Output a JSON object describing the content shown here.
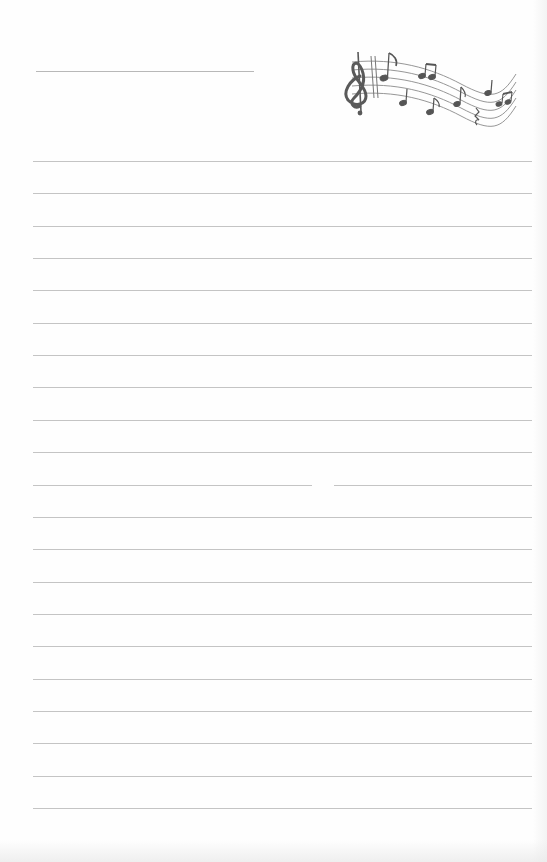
{
  "document": {
    "type": "lined-notepaper",
    "header": {
      "title_line": {
        "x": 36,
        "y": 71,
        "width": 218
      },
      "illustration": "music-staff-with-treble-clef-and-notes"
    },
    "ruled_lines": {
      "count": 21,
      "start_y": 161,
      "spacing": 32.35,
      "left": 33,
      "width": 499
    },
    "colors": {
      "paper": "#fefefe",
      "rule": "#c4c4c4",
      "ink": "#555555"
    }
  }
}
